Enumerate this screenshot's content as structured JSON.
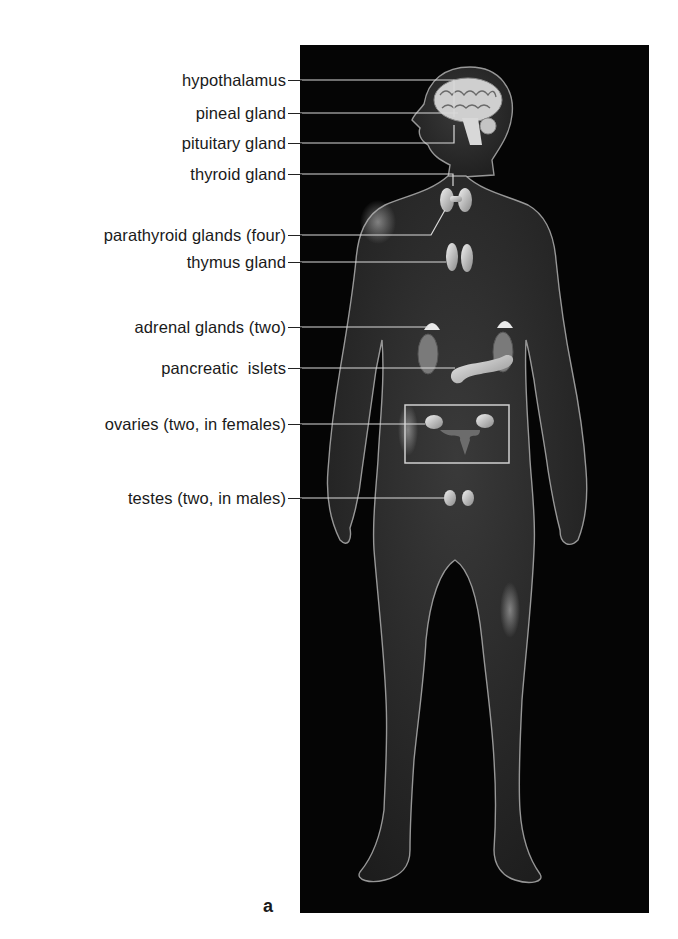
{
  "figure": {
    "panel_letter": "a",
    "panel_background": "#050505",
    "line_color": "#d9d9d9"
  },
  "labels": [
    {
      "id": "hypothalamus",
      "text": "hypothalamus",
      "y": 80
    },
    {
      "id": "pineal",
      "text": "pineal gland",
      "y": 113
    },
    {
      "id": "pituitary",
      "text": "pituitary gland",
      "y": 143
    },
    {
      "id": "thyroid",
      "text": "thyroid gland",
      "y": 174
    },
    {
      "id": "parathyroid",
      "text": "parathyroid glands (four)",
      "y": 235
    },
    {
      "id": "thymus",
      "text": "thymus gland",
      "y": 262
    },
    {
      "id": "adrenal",
      "text": "adrenal glands (two)",
      "y": 327
    },
    {
      "id": "pancreatic",
      "text": "pancreatic  islets",
      "y": 368
    },
    {
      "id": "ovaries",
      "text": "ovaries (two, in females)",
      "y": 424
    },
    {
      "id": "testes",
      "text": "testes (two, in males)",
      "y": 498
    }
  ]
}
